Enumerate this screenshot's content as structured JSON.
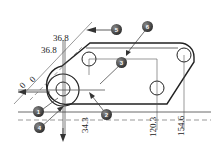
{
  "dimensions": {
    "d1": "36.8",
    "d2": "36.8",
    "a1": "0",
    "a2": "0",
    "h1": "34.3",
    "h2": "120.3",
    "h3": "154.6"
  },
  "callouts": [
    {
      "id": "1",
      "label": "1"
    },
    {
      "id": "2",
      "label": "2"
    },
    {
      "id": "3",
      "label": "3"
    },
    {
      "id": "4",
      "label": "4"
    },
    {
      "id": "5",
      "label": "5"
    },
    {
      "id": "6",
      "label": "6"
    }
  ],
  "colors": {
    "line": "#222222",
    "thin": "#555555",
    "callout": "#3a3a3a"
  }
}
